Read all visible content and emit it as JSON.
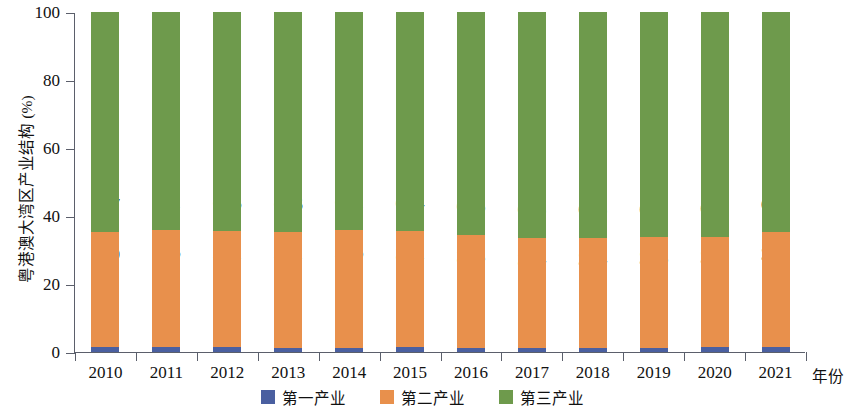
{
  "chart_data": {
    "type": "bar",
    "subtype": "stacked-bar-100",
    "title": "",
    "xlabel": "年份",
    "ylabel": "粤港澳大湾区产业结构 (%)",
    "categories": [
      "2010",
      "2011",
      "2012",
      "2013",
      "2014",
      "2015",
      "2016",
      "2017",
      "2018",
      "2019",
      "2020",
      "2021"
    ],
    "ylim": [
      0,
      100
    ],
    "yticks": [
      0,
      20,
      40,
      60,
      80,
      100
    ],
    "ytick_labels": [
      "0",
      "20",
      "40",
      "60",
      "80",
      "100"
    ],
    "grid": false,
    "legend_position": "bottom-center",
    "series": [
      {
        "name": "第一产业",
        "color": "#4a5fa0",
        "values": [
          1.4,
          1.4,
          1.4,
          1.3,
          1.3,
          1.4,
          1.2,
          1.1,
          1.1,
          1.2,
          1.4,
          1.4
        ],
        "labels": [
          "",
          "",
          "",
          "",
          "",
          "",
          "",
          "",
          "",
          "",
          "",
          ""
        ]
      },
      {
        "name": "第二产业",
        "color": "#e8904c",
        "values": [
          33.9,
          34.5,
          34.1,
          34.1,
          34.6,
          34.2,
          33.3,
          32.4,
          32.4,
          32.6,
          32.5,
          33.8
        ],
        "labels": [
          "33.9",
          "34.5",
          "34.1",
          "34.1",
          "34.6",
          "34.2",
          "33.3",
          "32.4",
          "32.4",
          "32.6",
          "32.5",
          "33.8"
        ]
      },
      {
        "name": "第三产业",
        "color": "#6e9a4c",
        "values": [
          64.7,
          64.1,
          64.5,
          64.6,
          64.1,
          64.4,
          65.5,
          66.5,
          66.5,
          66.2,
          66.1,
          64.8
        ],
        "labels": [
          "64.7",
          "64.1",
          "64.5",
          "64.6",
          "64.1",
          "64.4",
          "65.5",
          "66.5",
          "66.5",
          "66.2",
          "66.1",
          "64.8"
        ]
      }
    ]
  },
  "axis": {
    "y_title": "粤港澳大湾区产业结构 (%)",
    "x_title": "年份"
  },
  "legend": {
    "items": [
      {
        "label": "第一产业",
        "color": "#4a5fa0"
      },
      {
        "label": "第二产业",
        "color": "#e8904c"
      },
      {
        "label": "第三产业",
        "color": "#6e9a4c"
      }
    ]
  }
}
